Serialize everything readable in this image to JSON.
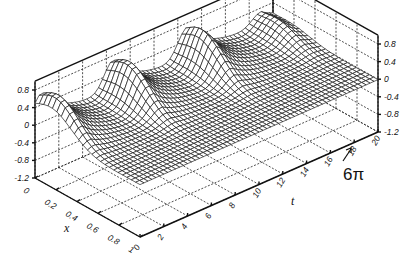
{
  "chart_data": {
    "type": "surface3d",
    "title": "",
    "xlabel": "x",
    "ylabel": "t",
    "zlabel": "",
    "x_ticks": [
      "0",
      "0.2",
      "0.4",
      "0.6",
      "0.8",
      "1"
    ],
    "t_ticks": [
      "0",
      "2",
      "4",
      "6",
      "8",
      "10",
      "12",
      "14",
      "16",
      "18",
      "20"
    ],
    "z_ticks": [
      "0.8",
      "0.4",
      "0",
      "-0.4",
      "-0.8",
      "-1.2"
    ],
    "z_ticks_right": [
      "0.8",
      "0.4",
      "0",
      "-0.4",
      "-0.8",
      "-1.2"
    ],
    "xlim": [
      0,
      1
    ],
    "tlim": [
      0,
      20
    ],
    "zlim": [
      -1.2,
      1.0
    ],
    "annotation": {
      "text": "6π",
      "points_to_t": 18.85
    },
    "surface": {
      "description": "Mesh surface u(x,t): periodic pulses peaking ~0.9 near x≈0.15 at t≈0.5, 6.5, 12.5, 18.8 (period 2π), decaying along x toward 0 and slightly negative troughs",
      "peaks": [
        {
          "t": 0.6,
          "x": 0.15,
          "z": 0.9
        },
        {
          "t": 6.6,
          "x": 0.15,
          "z": 0.92
        },
        {
          "t": 12.8,
          "x": 0.15,
          "z": 0.92
        },
        {
          "t": 19.0,
          "x": 0.15,
          "z": 0.4
        }
      ],
      "x_samples": 24,
      "t_samples": 60
    },
    "grid": true
  }
}
